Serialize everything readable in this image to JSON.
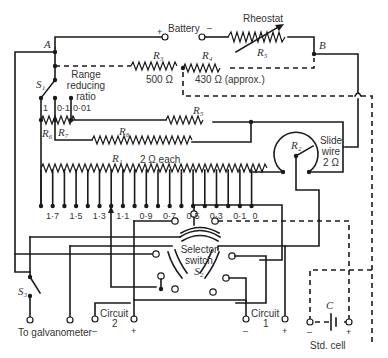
{
  "diagram": {
    "type": "potentiometer-circuit",
    "battery": {
      "label": "Battery",
      "plus": "+",
      "minus": "–"
    },
    "rheostat": {
      "label": "Rheostat",
      "ref": "R₅"
    },
    "nodes": {
      "A": "A",
      "B": "B"
    },
    "r3": {
      "ref": "R₃",
      "value": "500 Ω"
    },
    "r4": {
      "ref": "R₄",
      "value": "430 Ω (approx.)"
    },
    "r5": {
      "ref": "R₅"
    },
    "r6": {
      "ref": "R₆"
    },
    "r7": {
      "ref": "R₇"
    },
    "r8": {
      "ref": "R₈"
    },
    "r1": {
      "ref": "R₁",
      "value": "2 Ω each"
    },
    "r2": {
      "ref": "R₂"
    },
    "slide_wire": {
      "line1": "Slide",
      "line2": "wire",
      "line3": "2 Ω"
    },
    "s1": {
      "ref": "S₁",
      "label_line1": "Range",
      "label_line2": "reducing",
      "label_line3": "ratio",
      "positions": [
        "1",
        "0·1",
        "0·01"
      ]
    },
    "dial_labels": [
      "1·7",
      "1·5",
      "1·3",
      "1·1",
      "0·9",
      "0·7",
      "0·5",
      "0·3",
      "0·1",
      "0"
    ],
    "selector": {
      "line1": "Selector",
      "line2": "switch",
      "ref": "S₂"
    },
    "s3": {
      "ref": "S₃"
    },
    "galvanometer": {
      "label": "To galvanometer"
    },
    "circuit2": {
      "label": "Circuit",
      "number": "2",
      "minus": "–",
      "plus": "+"
    },
    "circuit1": {
      "label": "Circuit",
      "number": "1",
      "minus": "–",
      "plus": "+"
    },
    "std_cell": {
      "ref": "C",
      "label": "Std. cell",
      "minus": "–",
      "plus": "+"
    }
  }
}
